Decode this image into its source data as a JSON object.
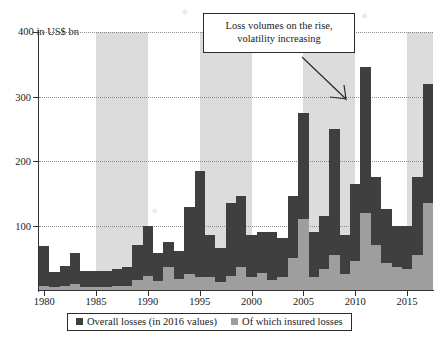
{
  "chart_data": {
    "type": "bar",
    "title": "",
    "subtitle": "",
    "xlabel": "",
    "ylabel": "in US$ bn",
    "ylim": [
      0,
      400
    ],
    "yticks": [
      100,
      200,
      300,
      400
    ],
    "ytick_labels": [
      "100",
      "200",
      "300",
      "400"
    ],
    "y_axis_unit_label": "400 in US$ bn",
    "xlim": [
      1979.5,
      2017.5
    ],
    "xticks": [
      1980,
      1985,
      1990,
      1995,
      2000,
      2005,
      2010,
      2015
    ],
    "xtick_labels": [
      "1980",
      "1985",
      "1990",
      "1995",
      "2000",
      "2005",
      "2010",
      "2015"
    ],
    "grid": "horizontal-dotted",
    "stacked": true,
    "legend_position": "bottom",
    "categories": [
      "1980",
      "1981",
      "1982",
      "1983",
      "1984",
      "1985",
      "1986",
      "1987",
      "1988",
      "1989",
      "1990",
      "1991",
      "1992",
      "1993",
      "1994",
      "1995",
      "1996",
      "1997",
      "1998",
      "1999",
      "2000",
      "2001",
      "2002",
      "2003",
      "2004",
      "2005",
      "2006",
      "2007",
      "2008",
      "2009",
      "2010",
      "2011",
      "2012",
      "2013",
      "2014",
      "2015",
      "2016",
      "2017"
    ],
    "series": [
      {
        "name": "Overall losses (in 2016 values)",
        "color": "#3f3f3f",
        "values": [
          68,
          28,
          38,
          58,
          30,
          30,
          30,
          32,
          36,
          70,
          100,
          57,
          75,
          60,
          128,
          185,
          85,
          65,
          135,
          145,
          85,
          90,
          90,
          80,
          145,
          275,
          90,
          115,
          250,
          85,
          165,
          345,
          175,
          125,
          100,
          100,
          175,
          320
        ]
      },
      {
        "name": "Of which insured losses",
        "color": "#9e9e9e",
        "values": [
          6,
          5,
          6,
          10,
          5,
          5,
          5,
          6,
          7,
          15,
          22,
          14,
          35,
          17,
          25,
          20,
          20,
          13,
          22,
          35,
          20,
          26,
          16,
          20,
          50,
          110,
          20,
          32,
          55,
          25,
          45,
          120,
          70,
          42,
          35,
          32,
          55,
          135
        ]
      }
    ],
    "shaded_bands": [
      {
        "from": 1985,
        "to": 1990
      },
      {
        "from": 1995,
        "to": 2000
      },
      {
        "from": 2005,
        "to": 2010
      },
      {
        "from": 2015,
        "to": 2017.5
      }
    ],
    "annotations": [
      {
        "name": "callout",
        "line1": "Loss volumes on the rise,",
        "line2": "volatility increasing",
        "points_to": 2006
      }
    ]
  },
  "legend": {
    "items": [
      {
        "label": "Overall losses (in 2016 values)",
        "color": "#3f3f3f"
      },
      {
        "label": "Of which insured losses",
        "color": "#9e9e9e"
      }
    ]
  },
  "colors": {
    "overall": "#3f3f3f",
    "insured": "#9e9e9e",
    "band": "#dcdcdc",
    "axis": "#333333",
    "grid": "#8a8a8a",
    "background": "#ffffff"
  }
}
